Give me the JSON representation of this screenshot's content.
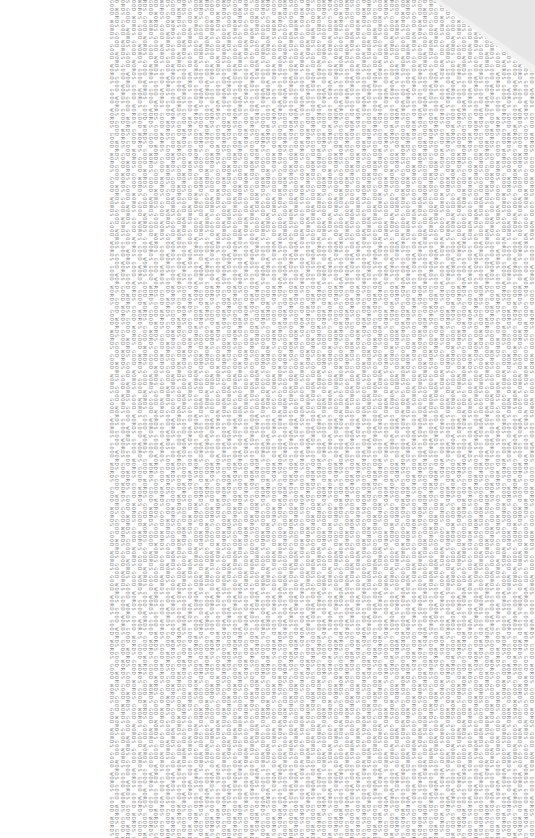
{
  "document": {
    "repeated_text": "GOOD WORDS ",
    "column_count": 76,
    "column_spacing_px": 5.6,
    "left_offset_px": 108,
    "text_color": "#8a8a8a",
    "background_color": "#ffffff"
  },
  "page_curl": {
    "fold_color": "#e6e6e6",
    "shadow_color": "#f2f2f2"
  }
}
